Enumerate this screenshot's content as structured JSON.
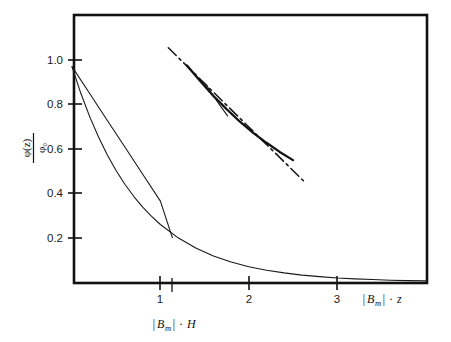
{
  "figure": {
    "title": "",
    "background": "#ffffff",
    "ink_color": "#111111"
  },
  "axes": {
    "y": {
      "label_numerator": "φ(z)",
      "label_denominator": "φ₀",
      "tick_labels": [
        "1.0",
        "0.8",
        "0.6",
        "0.4",
        "0.2"
      ],
      "tick_values": [
        1.0,
        0.8,
        0.6,
        0.4,
        0.2
      ],
      "range": [
        0.0,
        1.175
      ]
    },
    "x": {
      "label": "|Bₘ| · z",
      "label_parts": {
        "bar_left": "|",
        "base": "B",
        "sub": "m",
        "bar_right": "|",
        "dot": "·",
        "var": "z"
      },
      "tick_labels": [
        "1",
        "2",
        "3"
      ],
      "tick_values": [
        1,
        2,
        3
      ],
      "range": [
        0.0,
        4.03
      ]
    },
    "annotation": {
      "label": "|Bₘ| · H",
      "label_parts": {
        "bar_left": "|",
        "base": "B",
        "sub": "m",
        "bar_right": "|",
        "dot": "·",
        "var": "H"
      },
      "tick_at_x": 1.135
    }
  },
  "chart_data": {
    "type": "line",
    "title": "",
    "xlabel": "|B_m| · z",
    "ylabel": "φ(z)/φ₀",
    "xlim": [
      0.0,
      4.03
    ],
    "ylim": [
      0.0,
      1.175
    ],
    "grid": false,
    "legend": "none",
    "xticks": [
      1,
      2,
      3
    ],
    "yticks": [
      0.2,
      0.4,
      0.6,
      0.8,
      1.0
    ],
    "annotations": [
      {
        "text": "|B_m| · H",
        "x": 1.135,
        "y": 0.0,
        "placement": "below-axis"
      },
      {
        "text": "|B_m| · z",
        "x": 3.55,
        "y": 0.0,
        "placement": "axis-right"
      }
    ],
    "series": [
      {
        "name": "linear-approximation",
        "style": "solid-thin",
        "color": "#1a1a1a",
        "comment": "straight tangent line from origin value down to zero at |Bm|H",
        "x": [
          0.0,
          0.2,
          0.4,
          0.6,
          0.8,
          1.0,
          1.135
        ],
        "y": [
          0.97,
          0.8489,
          0.7278,
          0.6067,
          0.4856,
          0.3645,
          0.2
        ],
        "points": [
          [
            0.0,
            0.97
          ],
          [
            1.135,
            0.0
          ]
        ]
      },
      {
        "name": "exponential-decay",
        "style": "solid-thin",
        "color": "#1a1a1a",
        "comment": "phi(z)/phi0 = 0.97 * exp(-1.32 z)",
        "x": [
          0.0,
          0.1,
          0.2,
          0.3,
          0.4,
          0.5,
          0.6,
          0.7,
          0.8,
          0.9,
          1.0,
          1.2,
          1.4,
          1.6,
          1.8,
          2.0,
          2.2,
          2.4,
          2.6,
          2.8,
          3.0,
          3.2,
          3.4,
          3.6,
          3.8,
          4.0
        ],
        "y": [
          0.97,
          0.85,
          0.745,
          0.653,
          0.572,
          0.501,
          0.439,
          0.385,
          0.337,
          0.296,
          0.259,
          0.199,
          0.153,
          0.117,
          0.09,
          0.069,
          0.053,
          0.041,
          0.031,
          0.024,
          0.018,
          0.014,
          0.011,
          0.008,
          0.006,
          0.005
        ]
      },
      {
        "name": "dash-dot-asymptote",
        "style": "dash-dot",
        "color": "#1a1a1a",
        "comment": "straight dash-dot reference line crossing upper-right region",
        "points": [
          [
            1.09,
            1.055
          ],
          [
            2.62,
            0.455
          ]
        ],
        "x": [
          1.09,
          2.62
        ],
        "y": [
          1.055,
          0.455
        ]
      },
      {
        "name": "overlay-solid-curve",
        "style": "solid-thick",
        "color": "#111111",
        "comment": "bold solid curve segment tracking the dash-dot line",
        "x": [
          1.3,
          1.45,
          1.6,
          1.75,
          1.9,
          2.05,
          2.2,
          2.35,
          2.5
        ],
        "y": [
          0.975,
          0.905,
          0.838,
          0.778,
          0.722,
          0.672,
          0.627,
          0.586,
          0.549
        ]
      },
      {
        "name": "overlay-thin-branch",
        "style": "solid-thin",
        "color": "#1a1a1a",
        "comment": "short thin branch diverging below the bold curve near x=1.6",
        "x": [
          1.52,
          1.6,
          1.68,
          1.76
        ],
        "y": [
          0.887,
          0.838,
          0.792,
          0.748
        ]
      }
    ]
  }
}
